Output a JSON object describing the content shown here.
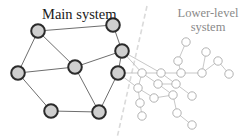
{
  "labels": {
    "main": "Main system",
    "lower": [
      "Lower-level",
      "system"
    ]
  },
  "colors": {
    "main_node_fill": "#cfcfcf",
    "main_node_stroke": "#2b2b2b",
    "main_edge": "#6e6e6e",
    "lower_node_stroke": "#a9a9a9",
    "lower_edge": "#b9b9b9",
    "lower_label": "#8a8a8a"
  },
  "main_system": {
    "nodes": [
      "A",
      "B",
      "C",
      "D",
      "E",
      "F",
      "G",
      "H"
    ],
    "edges": [
      [
        "A",
        "B"
      ],
      [
        "A",
        "D"
      ],
      [
        "A",
        "E"
      ],
      [
        "B",
        "C"
      ],
      [
        "C",
        "D"
      ],
      [
        "C",
        "G"
      ],
      [
        "D",
        "E"
      ],
      [
        "D",
        "H"
      ],
      [
        "E",
        "F"
      ],
      [
        "F",
        "H"
      ],
      [
        "G",
        "H"
      ]
    ]
  },
  "lower_system": {
    "nodes": [
      "L1",
      "L2",
      "L3",
      "L4",
      "L5",
      "L6",
      "L7",
      "L8",
      "L9",
      "L10",
      "L11",
      "L12",
      "L13",
      "L14",
      "L15",
      "L16",
      "L17",
      "L18",
      "L19"
    ],
    "edges": [
      [
        "L1",
        "L2"
      ],
      [
        "L2",
        "L7"
      ],
      [
        "L3",
        "L6"
      ],
      [
        "L6",
        "L4"
      ],
      [
        "L4",
        "L5"
      ],
      [
        "L6",
        "L7"
      ],
      [
        "L7",
        "L8"
      ],
      [
        "L8",
        "L9"
      ],
      [
        "L9",
        "L10"
      ],
      [
        "L10",
        "L11"
      ],
      [
        "L8",
        "L11"
      ],
      [
        "L11",
        "L12"
      ],
      [
        "L9",
        "L13"
      ],
      [
        "L13",
        "L14"
      ],
      [
        "L14",
        "L15"
      ],
      [
        "L10",
        "L15"
      ],
      [
        "L13",
        "L16"
      ],
      [
        "L16",
        "L17"
      ],
      [
        "L15",
        "L18"
      ],
      [
        "L18",
        "L19"
      ]
    ],
    "links_to_main": [
      [
        "C",
        "L9"
      ],
      [
        "C",
        "L8"
      ],
      [
        "G",
        "L13"
      ],
      [
        "G",
        "L9"
      ]
    ]
  }
}
